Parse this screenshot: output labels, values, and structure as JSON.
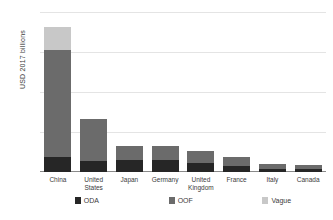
{
  "chart_data": {
    "type": "bar",
    "subtype": "stacked-vertical",
    "title": "",
    "xlabel": "",
    "ylabel": "USD 2017 billions",
    "ylim": [
      0,
      500
    ],
    "yticks": [
      0,
      125,
      250,
      375,
      500
    ],
    "ytick_labels": [
      "$0",
      "$125",
      "$250",
      "$375",
      "$500"
    ],
    "grid": true,
    "legend_position": "bottom",
    "categories": [
      "China",
      "United States",
      "Japan",
      "Germany",
      "United Kingdom",
      "France",
      "Italy",
      "Canada"
    ],
    "series": [
      {
        "name": "ODA",
        "color": "#262626",
        "values": [
          47,
          35,
          37,
          38,
          28,
          19,
          8,
          10
        ]
      },
      {
        "name": "OOF",
        "color": "#6b6b6b",
        "values": [
          333,
          130,
          45,
          42,
          37,
          28,
          17,
          12
        ]
      },
      {
        "name": "Vague",
        "color": "#c8c8c8",
        "values": [
          73,
          0,
          0,
          0,
          0,
          0,
          0,
          0
        ]
      }
    ],
    "totals": [
      453,
      165,
      82,
      80,
      65,
      47,
      25,
      22
    ]
  },
  "legend": {
    "items": [
      {
        "label": "ODA",
        "color": "#262626"
      },
      {
        "label": "OOF",
        "color": "#6b6b6b"
      },
      {
        "label": "Vague",
        "color": "#c8c8c8"
      }
    ]
  }
}
